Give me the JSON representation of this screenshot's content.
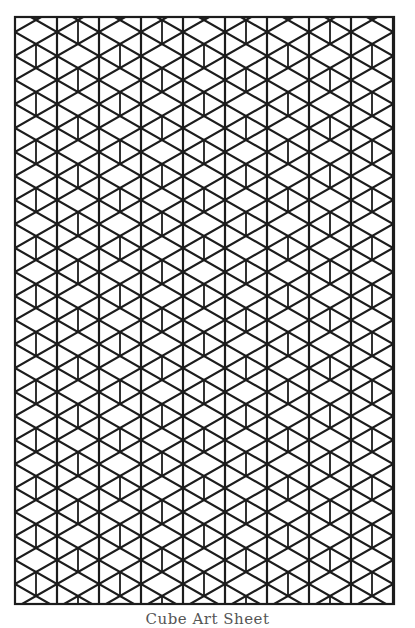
{
  "sheet": {
    "caption": "Cube Art Sheet",
    "line_color": "#1c1c1c",
    "background": "#ffffff",
    "pattern": "isometric-cubes",
    "frame": {
      "left": 15,
      "top": 17,
      "right": 394,
      "bottom": 604
    },
    "grid": {
      "column_step": 21,
      "row_step": 24,
      "full_vertical_start_x": 57,
      "full_vertical_spacing": 42,
      "short_vertical_start_x": 36,
      "origin_y": 20
    }
  }
}
